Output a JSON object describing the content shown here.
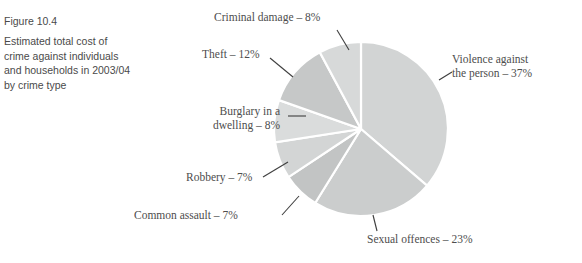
{
  "caption": {
    "figure_number": "Figure 10.4",
    "description": "Estimated total cost of crime against individuals and households in 2003/04 by crime type"
  },
  "labels": {
    "criminal_damage": "Criminal damage – 8%",
    "theft": "Theft – 12%",
    "burglary_line1": "Burglary in a",
    "burglary_line2": "dwelling – 8%",
    "robbery": "Robbery – 7%",
    "common_assault": "Common assault – 7%",
    "sexual_offences": "Sexual offences – 23%",
    "violence_line1": "Violence against",
    "violence_line2": "the person – 37%"
  },
  "chart_data": {
    "type": "pie",
    "title": "Estimated total cost of crime against individuals and households in 2003/04 by crime type",
    "unit": "percent",
    "legend_position": "callout-labels",
    "grid": false,
    "start_angle_deg": 0,
    "direction": "clockwise",
    "categories": [
      "Violence against the person",
      "Sexual offences",
      "Common assault",
      "Robbery",
      "Burglary in a dwelling",
      "Theft",
      "Criminal damage"
    ],
    "values": [
      37,
      23,
      7,
      7,
      8,
      12,
      8
    ],
    "slices": [
      {
        "label": "Violence against the person",
        "value": 37,
        "color": "#d2d4d4"
      },
      {
        "label": "Sexual offences",
        "value": 23,
        "color": "#cbcdcd"
      },
      {
        "label": "Common assault",
        "value": 7,
        "color": "#c2c4c4"
      },
      {
        "label": "Robbery",
        "value": 7,
        "color": "#d3d5d5"
      },
      {
        "label": "Burglary in a dwelling",
        "value": 8,
        "color": "#dadcdc"
      },
      {
        "label": "Theft",
        "value": 12,
        "color": "#c6c8c8"
      },
      {
        "label": "Criminal damage",
        "value": 8,
        "color": "#d7d9d9"
      }
    ],
    "geometry": {
      "center_x": 361,
      "center_y": 129,
      "radius": 87
    },
    "colors": {
      "slice_separator": "#ffffff",
      "leader_line": "#3f3f3f",
      "label_text": "#4d4d4d",
      "caption_text": "#4a4a4a",
      "background": "#ffffff"
    }
  },
  "leader_lines": [
    {
      "name": "criminal-damage",
      "x1": 337,
      "y1": 30,
      "x2": 349,
      "y2": 50
    },
    {
      "name": "theft",
      "x1": 270,
      "y1": 58,
      "x2": 293,
      "y2": 77
    },
    {
      "name": "burglary",
      "x1": 288,
      "y1": 116,
      "x2": 306,
      "y2": 116
    },
    {
      "name": "robbery",
      "x1": 263,
      "y1": 177,
      "x2": 288,
      "y2": 162
    },
    {
      "name": "common-assault",
      "x1": 282,
      "y1": 215,
      "x2": 299,
      "y2": 196
    },
    {
      "name": "sexual-offences",
      "x1": 377,
      "y1": 231,
      "x2": 373,
      "y2": 215
    },
    {
      "name": "violence",
      "x1": 439,
      "y1": 80,
      "x2": 452,
      "y2": 72
    }
  ]
}
